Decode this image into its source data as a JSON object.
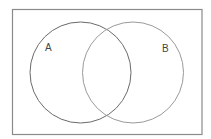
{
  "diagram": {
    "type": "venn",
    "sets": [
      {
        "label": "A",
        "stroke": "#6a6a6a"
      },
      {
        "label": "B",
        "stroke": "#9a9a9a"
      }
    ],
    "frame_stroke": "#8a8a8a"
  }
}
